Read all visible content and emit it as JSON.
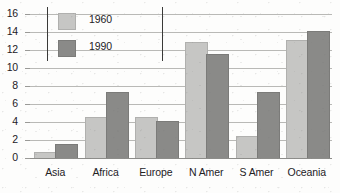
{
  "chart_data": {
    "type": "bar",
    "title": "",
    "xlabel": "",
    "ylabel": "",
    "categories": [
      "Asia",
      "Africa",
      "Europe",
      "N Amer",
      "S Amer",
      "Oceania"
    ],
    "series": [
      {
        "name": "1960",
        "color": "#c6c6c4",
        "values": [
          0.6,
          4.5,
          4.5,
          12.8,
          2.3,
          13.0
        ]
      },
      {
        "name": "1990",
        "color": "#8a8a88",
        "values": [
          1.5,
          7.2,
          4.0,
          11.5,
          7.2,
          14.0
        ]
      }
    ],
    "ylim": [
      0,
      16
    ],
    "yticks": [
      0,
      2,
      4,
      6,
      8,
      10,
      12,
      14,
      16
    ],
    "ytick_labels": [
      "0",
      "2",
      "4",
      "6",
      "8",
      "10",
      "12",
      "14",
      "16"
    ],
    "grid": true,
    "legend_position": "top-left",
    "legend_entries": [
      "1960",
      "1990"
    ]
  }
}
